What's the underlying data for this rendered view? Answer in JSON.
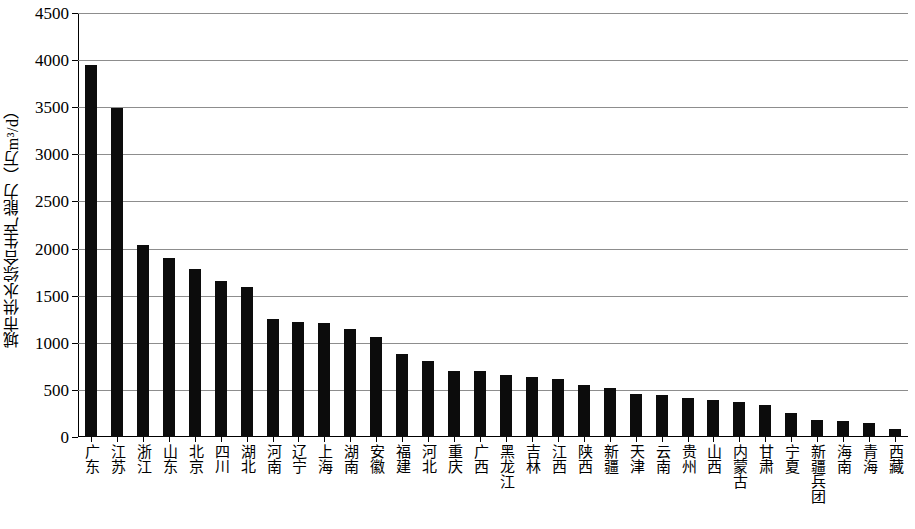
{
  "chart_data": {
    "type": "bar",
    "title": "",
    "xlabel": "",
    "ylabel": "城市供水综合生产能力（万m³/d）",
    "ylim": [
      0,
      4500
    ],
    "ytick_labels": [
      "0",
      "500",
      "1000",
      "1500",
      "2000",
      "2500",
      "3000",
      "3500",
      "4000",
      "4500"
    ],
    "ytick_values": [
      0,
      500,
      1000,
      1500,
      2000,
      2500,
      3000,
      3500,
      4000,
      4500
    ],
    "grid": true,
    "legend": false,
    "bar_color": "#0c0c0c",
    "categories": [
      "广东",
      "江苏",
      "浙江",
      "山东",
      "北京",
      "四川",
      "湖北",
      "河南",
      "辽宁",
      "上海",
      "湖南",
      "安徽",
      "福建",
      "河北",
      "重庆",
      "广西",
      "黑龙江",
      "吉林",
      "江西",
      "陕西",
      "新疆",
      "天津",
      "云南",
      "贵州",
      "山西",
      "内蒙古",
      "甘肃",
      "宁夏",
      "新疆兵团",
      "海南",
      "青海",
      "西藏"
    ],
    "values": [
      3950,
      3490,
      2040,
      1900,
      1780,
      1660,
      1590,
      1250,
      1220,
      1215,
      1150,
      1060,
      880,
      810,
      700,
      705,
      655,
      640,
      620,
      555,
      520,
      460,
      445,
      415,
      390,
      370,
      340,
      250,
      180,
      165,
      145,
      80
    ]
  }
}
